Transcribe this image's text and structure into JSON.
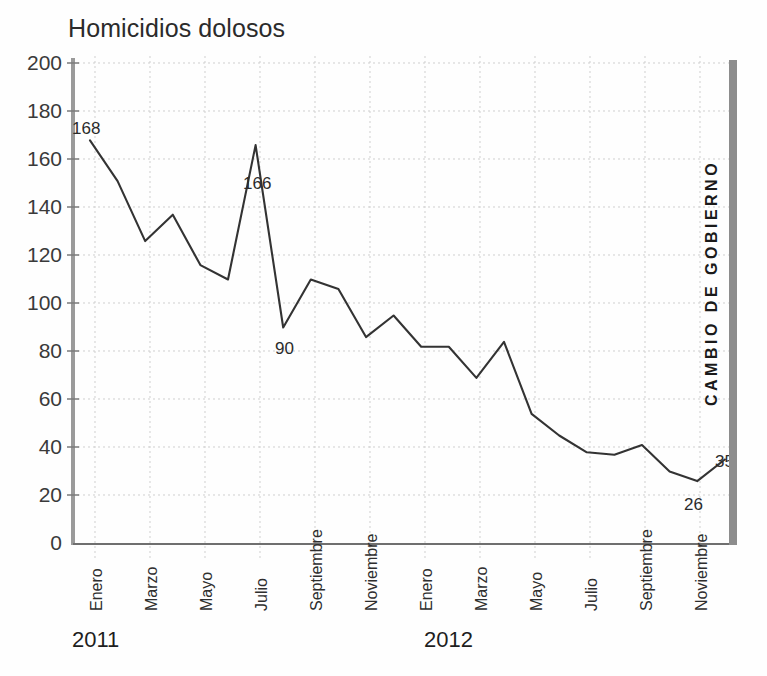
{
  "chart_data": {
    "type": "line",
    "title": "Homicidios dolosos",
    "xlabel": "",
    "ylabel": "",
    "ylim": [
      0,
      200
    ],
    "ytick_step": 20,
    "yticks": [
      200,
      180,
      160,
      140,
      120,
      100,
      80,
      60,
      40,
      20,
      0
    ],
    "grid": true,
    "legend": "none",
    "x": [
      "Enero 2011",
      "Febrero 2011",
      "Marzo 2011",
      "Abril 2011",
      "Mayo 2011",
      "Junio 2011",
      "Julio 2011",
      "Agosto 2011",
      "Septiembre 2011",
      "Octubre 2011",
      "Noviembre 2011",
      "Diciembre 2011",
      "Enero 2012",
      "Febrero 2012",
      "Marzo 2012",
      "Abril 2012",
      "Mayo 2012",
      "Junio 2012",
      "Julio 2012",
      "Agosto 2012",
      "Septiembre 2012",
      "Octubre 2012",
      "Noviembre 2012",
      "Diciembre 2012"
    ],
    "values": [
      168,
      151,
      126,
      137,
      116,
      110,
      166,
      90,
      110,
      106,
      86,
      95,
      82,
      82,
      69,
      84,
      54,
      45,
      38,
      37,
      41,
      30,
      26,
      35
    ],
    "xtick_labels": [
      "Enero",
      "Marzo",
      "Mayo",
      "Julio",
      "Septiembre",
      "Noviembre",
      "Enero",
      "Marzo",
      "Mayo",
      "Julio",
      "Septiembre",
      "Noviembre"
    ],
    "year_groups": [
      "2011",
      "2012"
    ],
    "annotations": [
      {
        "label": "168",
        "month": "Enero 2011",
        "value": 168
      },
      {
        "label": "166",
        "month": "Julio 2011",
        "value": 166
      },
      {
        "label": "90",
        "month": "Agosto 2011",
        "value": 90
      },
      {
        "label": "26",
        "month": "Noviembre 2012",
        "value": 26
      },
      {
        "label": "35",
        "month": "Diciembre 2012",
        "value": 35
      }
    ],
    "marker_annotation": "CAMBIO DE GOBIERNO",
    "line_color": "#333333",
    "grid_color": "#cfcfcf",
    "axis_color": "#8d8d8d"
  },
  "axis": {
    "y_labels": {
      "t200": "200",
      "t180": "180",
      "t160": "160",
      "t140": "140",
      "t120": "120",
      "t100": "100",
      "t80": "80",
      "t60": "60",
      "t40": "40",
      "t20": "20",
      "t0": "0"
    },
    "x_labels": {
      "m1": "Enero",
      "m2": "Marzo",
      "m3": "Mayo",
      "m4": "Julio",
      "m5": "Septiembre",
      "m6": "Noviembre",
      "m7": "Enero",
      "m8": "Marzo",
      "m9": "Mayo",
      "m10": "Julio",
      "m11": "Septiembre",
      "m12": "Noviembre"
    },
    "years": {
      "y1": "2011",
      "y2": "2012"
    }
  },
  "labels": {
    "p168": "168",
    "p166": "166",
    "p90": "90",
    "p26": "26",
    "p35": "35",
    "regime_change": "CAMBIO DE GOBIERNO"
  }
}
